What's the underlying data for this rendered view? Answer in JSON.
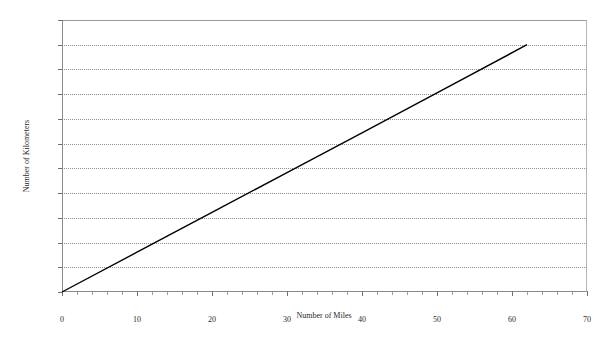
{
  "chart_data": {
    "type": "line",
    "title": "",
    "xlabel": "Number of Miles",
    "ylabel": "Number of Kilometers",
    "xlim": [
      0,
      70
    ],
    "ylim": [
      0,
      110
    ],
    "xticks": [
      0,
      10,
      20,
      30,
      40,
      50,
      60,
      70
    ],
    "yticks": [
      0,
      10,
      20,
      30,
      40,
      50,
      60,
      70,
      80,
      90,
      100,
      110
    ],
    "xtick_labels": [
      "0",
      "10",
      "20",
      "30",
      "40",
      "50",
      "60",
      "70"
    ],
    "ytick_labels": [
      "0",
      "10",
      "20",
      "30",
      "40",
      "50",
      "60",
      "70",
      "80",
      "90",
      "100",
      "110"
    ],
    "grid": {
      "horizontal": true,
      "vertical": false,
      "style": "dotted",
      "color": "#8e8e8e"
    },
    "legend": {
      "visible": false,
      "position": "none"
    },
    "series": [
      {
        "name": "miles-to-kilometers",
        "color": "#000000",
        "line_width": 1.4,
        "markers": false,
        "x": [
          0,
          62
        ],
        "y": [
          0,
          100
        ],
        "points": [
          {
            "x": 0,
            "y": 0
          },
          {
            "x": 10,
            "y": 16.1
          },
          {
            "x": 20,
            "y": 32.2
          },
          {
            "x": 30,
            "y": 48.3
          },
          {
            "x": 40,
            "y": 64.4
          },
          {
            "x": 50,
            "y": 80.5
          },
          {
            "x": 62,
            "y": 100
          }
        ]
      }
    ],
    "annotations": [],
    "colors": {
      "background": "#ffffff",
      "plot_border": "#8c8c8c",
      "gridline": "#8e8e8e",
      "text": "#222222",
      "series": "#000000"
    }
  }
}
